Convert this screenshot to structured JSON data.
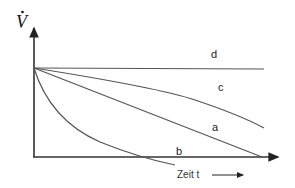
{
  "diagram": {
    "y_axis_label": "V",
    "y_axis_label_accent": "dot",
    "x_axis_label": "Zeit t",
    "curves": [
      {
        "id": "d",
        "label": "d",
        "shape": "horizontal line (constant)"
      },
      {
        "id": "c",
        "label": "c",
        "shape": "concave down, slowly decreasing"
      },
      {
        "id": "a",
        "label": "a",
        "shape": "linear decrease"
      },
      {
        "id": "b",
        "label": "b",
        "shape": "convex, rapid decrease"
      }
    ],
    "colors": {
      "axis": "#333333",
      "curve": "#555555"
    }
  }
}
